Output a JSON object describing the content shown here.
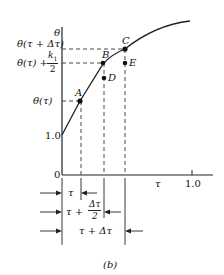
{
  "figure": {
    "caption": "(b)",
    "y_axis": {
      "symbol": "θ",
      "tick_labels": {
        "origin": "0",
        "one": "1.0"
      }
    },
    "x_axis": {
      "symbol": "τ",
      "tick_labels": {
        "one": "1.0"
      }
    },
    "y_labels": {
      "theta_tau_dt": "θ(τ + Δτ)",
      "theta_tau_k1_prefix": "θ(τ) +",
      "k1_num": "k",
      "k1_sub": "1",
      "k1_den": "2",
      "theta_tau": "θ(τ)"
    },
    "points": {
      "A": "A",
      "B": "B",
      "C": "C",
      "D": "D",
      "E": "E"
    },
    "dimensions": {
      "d1": "τ",
      "d2_prefix": "τ +",
      "d2_num": "Δτ",
      "d2_den": "2",
      "d3": "τ + Δτ"
    }
  }
}
